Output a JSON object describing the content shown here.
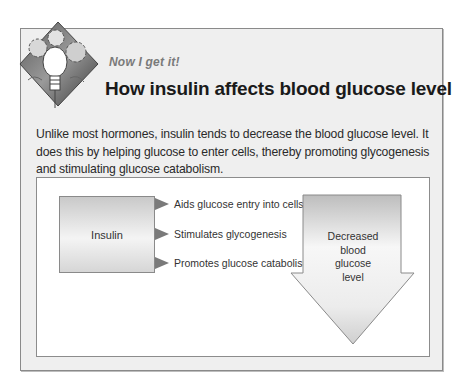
{
  "header": {
    "kicker": "Now I get it!",
    "title": "How insulin affects blood glucose level",
    "logo_icon": "lightbulb-gears-icon"
  },
  "body": {
    "paragraph": "Unlike most hormones, insulin tends to decrease the blood glucose level. It does this by helping glucose to enter cells, thereby promoting glycogenesis and stimulating glucose catabolism."
  },
  "diagram": {
    "source": "Insulin",
    "effects": [
      "Aids glucose entry into cells",
      "Stimulates glycogenesis",
      "Promotes glucose catabolism"
    ],
    "result_lines": [
      "Decreased",
      "blood",
      "glucose",
      "level"
    ]
  }
}
